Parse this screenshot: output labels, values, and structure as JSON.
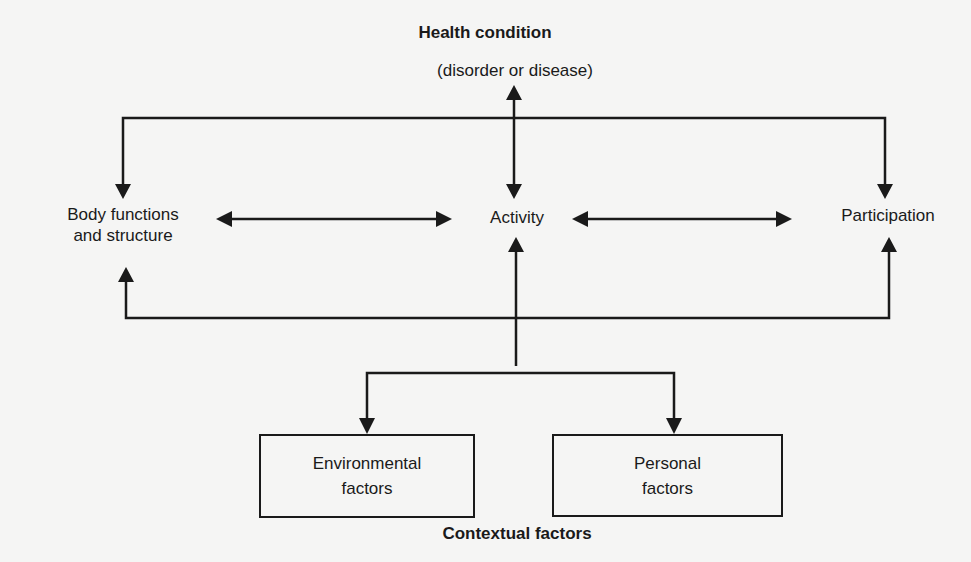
{
  "nodes": {
    "health_condition": {
      "title": "Health condition",
      "subtitle": "(disorder or disease)"
    },
    "body_functions": {
      "line1": "Body functions",
      "line2": "and structure"
    },
    "activity": {
      "label": "Activity"
    },
    "participation": {
      "label": "Participation"
    },
    "environmental": {
      "line1": "Environmental",
      "line2": "factors"
    },
    "personal": {
      "line1": "Personal",
      "line2": "factors"
    },
    "contextual": {
      "label": "Contextual factors"
    }
  },
  "edges": [
    {
      "from": "health_condition",
      "to": "activity",
      "type": "bidirectional"
    },
    {
      "from": "health_condition",
      "to": "body_functions",
      "type": "directed"
    },
    {
      "from": "health_condition",
      "to": "participation",
      "type": "directed"
    },
    {
      "from": "body_functions",
      "to": "activity",
      "type": "bidirectional"
    },
    {
      "from": "activity",
      "to": "participation",
      "type": "bidirectional"
    },
    {
      "from": "contextual",
      "to": "activity",
      "type": "directed"
    },
    {
      "from": "contextual",
      "to": "body_functions",
      "type": "directed"
    },
    {
      "from": "contextual",
      "to": "participation",
      "type": "directed"
    },
    {
      "from": "contextual",
      "to": "environmental",
      "type": "directed"
    },
    {
      "from": "contextual",
      "to": "personal",
      "type": "directed"
    }
  ],
  "colors": {
    "line": "#1a1a1a",
    "background": "#f5f5f4"
  }
}
